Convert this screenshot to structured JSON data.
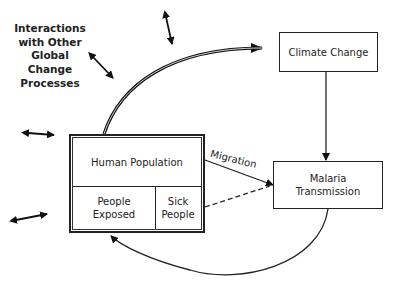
{
  "diagram": {
    "title_lines": [
      "Interactions",
      "with Other",
      "Global",
      "Change",
      "Processes"
    ],
    "nodes": {
      "climate_change": {
        "label": "Climate Change"
      },
      "malaria_transmission": {
        "label_line1": "Malaria",
        "label_line2": "Transmission"
      },
      "human_population": {
        "label": "Human Population",
        "exposed_line1": "People",
        "exposed_line2": "Exposed",
        "sick_line1": "Sick",
        "sick_line2": "People"
      }
    },
    "edges": [
      {
        "from": "human_population",
        "to": "climate_change",
        "style": "thick-curved"
      },
      {
        "from": "climate_change",
        "to": "malaria_transmission",
        "style": "solid"
      },
      {
        "from": "human_population",
        "to": "malaria_transmission",
        "style": "solid",
        "label": "Migration"
      },
      {
        "from": "sick_people",
        "to": "malaria_transmission",
        "style": "dashed"
      },
      {
        "from": "malaria_transmission",
        "to": "people_exposed",
        "style": "curved"
      }
    ],
    "migration_label": "Migration",
    "double_arrows_count": 5
  }
}
